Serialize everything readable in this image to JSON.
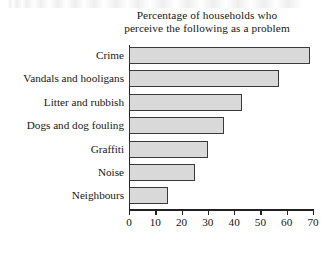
{
  "chart_data": {
    "type": "bar",
    "orientation": "horizontal",
    "title": "Percentage of households who perceive the following as a problem",
    "title_lines": [
      "Percentage of households who",
      "perceive the following as a problem"
    ],
    "categories": [
      "Crime",
      "Vandals and hooligans",
      "Litter and rubbish",
      "Dogs and dog fouling",
      "Graffiti",
      "Noise",
      "Neighbours"
    ],
    "values": [
      69,
      57,
      43,
      36,
      30,
      25,
      15
    ],
    "xlabel": "",
    "ylabel": "",
    "xlim": [
      0,
      70
    ],
    "xticks": [
      0,
      10,
      20,
      30,
      40,
      50,
      60,
      70
    ],
    "xtick_labels": [
      "0",
      "10",
      "20",
      "30",
      "40",
      "50",
      "60",
      "70"
    ],
    "grid": false,
    "legend": null,
    "bar_fill_color": "#d9d9d9",
    "bar_border_color": "#3a3a3a",
    "axis_color": "#222222",
    "background_color": "#ffffff"
  }
}
